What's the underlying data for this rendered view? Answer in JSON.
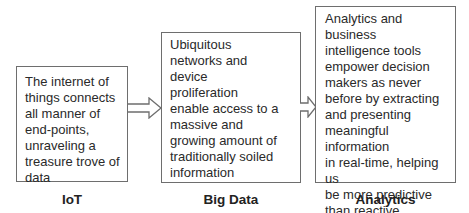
{
  "diagram": {
    "type": "flow",
    "direction": "left-to-right",
    "nodes": [
      {
        "id": "iot",
        "label": "IoT",
        "text": "The internet of things connects all manner of end-points, unraveling a treasure trove of data",
        "lines": [
          "The internet of",
          "things connects",
          "all manner of",
          "end-points,",
          "unraveling a",
          "treasure trove of",
          "data"
        ]
      },
      {
        "id": "big_data",
        "label": "Big Data",
        "text": "Ubiquitous networks and device proliferation enable access to a massive and growing amount of traditionally soiled information",
        "lines": [
          "Ubiquitous",
          "networks and",
          "device",
          "proliferation",
          "enable access to a",
          "massive and",
          "growing amount of",
          "traditionally soiled",
          "information"
        ]
      },
      {
        "id": "analytics",
        "label": "Analytics",
        "text": "Analytics and business intelligence tools empower decision makers as never before by extracting and presenting meaningful information in real-time, helping us be more predictive than reactive",
        "lines": [
          "Analytics and business",
          "intelligence tools",
          "empower decision",
          "makers as never",
          "before by extracting",
          "and presenting",
          "meaningful information",
          "in real-time, helping us",
          "be more predictive",
          "than reactive"
        ]
      }
    ],
    "edges": [
      {
        "from": "iot",
        "to": "big_data",
        "style": "hollow-block-arrow"
      },
      {
        "from": "big_data",
        "to": "analytics",
        "style": "hollow-block-arrow"
      }
    ],
    "colors": {
      "border": "#6e6e6e",
      "text": "#2a2a2a",
      "background": "#ffffff"
    }
  }
}
